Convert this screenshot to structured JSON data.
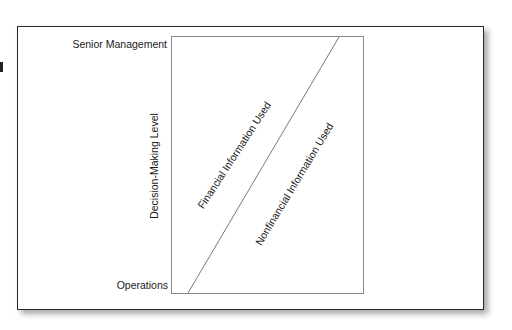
{
  "diagram": {
    "y_axis": {
      "label": "Decision-Making Level",
      "top_label": "Senior Management",
      "bottom_label": "Operations"
    },
    "regions": [
      {
        "id": "financial",
        "label": "Financial Information Used"
      },
      {
        "id": "nonfinancial",
        "label": "Nonfinancial Information Used"
      }
    ],
    "colors": {
      "frame_border": "#2a2a2a",
      "inner_box": "#8a8a8a",
      "divider_line": "#6a6a6a",
      "text": "#1a1a1a"
    }
  }
}
